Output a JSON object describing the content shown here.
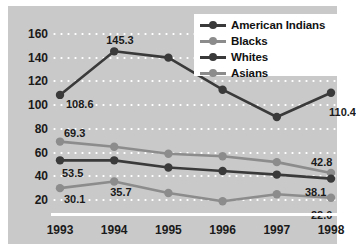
{
  "chart_data": {
    "type": "line",
    "title": "",
    "subtitle": "",
    "xlabel": "",
    "ylabel": "",
    "categories": [
      "1993",
      "1994",
      "1995",
      "1996",
      "1997",
      "1998"
    ],
    "ylim": [
      10,
      170
    ],
    "yticks": [
      20,
      40,
      60,
      80,
      100,
      120,
      140,
      160
    ],
    "ytick_labels": [
      "20",
      "40",
      "60",
      "80",
      "100",
      "120",
      "140",
      "160"
    ],
    "grid": "horizontal-dotted",
    "legend_position": "top-right",
    "series": [
      {
        "name": "American Indians",
        "color": "#3a3a3a",
        "values": [
          108.6,
          145.3,
          140.0,
          113.0,
          90.0,
          110.4
        ],
        "labels": [
          "108.6",
          "145.3",
          "",
          "",
          "",
          "110.4"
        ]
      },
      {
        "name": "Blacks",
        "color": "#8c8c8c",
        "values": [
          69.3,
          65.0,
          59.0,
          57.0,
          52.0,
          42.8
        ],
        "labels": [
          "69.3",
          "",
          "",
          "",
          "",
          "42.8"
        ]
      },
      {
        "name": "Whites",
        "color": "#3a3a3a",
        "values": [
          53.5,
          53.5,
          47.5,
          44.5,
          41.5,
          38.1
        ],
        "labels": [
          "53.5",
          "",
          "",
          "",
          "",
          "38.1"
        ]
      },
      {
        "name": "Asians",
        "color": "#8c8c8c",
        "values": [
          30.1,
          35.7,
          26.0,
          19.0,
          25.0,
          22.0
        ],
        "labels": [
          "30.1",
          "35.7",
          "",
          "",
          "",
          "22.0"
        ]
      }
    ],
    "colors": {
      "plot_background": "#c9c9c9",
      "page_background": "#ffffff",
      "gridline": "#ffffff",
      "axis_line": "#ffffff",
      "dark_series": "#3a3a3a",
      "gray_series": "#8c8c8c",
      "text": "#1a1a1a"
    }
  },
  "legend": {
    "items": [
      {
        "label": "American Indians",
        "color": "#3a3a3a"
      },
      {
        "label": "Blacks",
        "color": "#8c8c8c"
      },
      {
        "label": "Whites",
        "color": "#3a3a3a"
      },
      {
        "label": "Asians",
        "color": "#8c8c8c"
      }
    ]
  }
}
